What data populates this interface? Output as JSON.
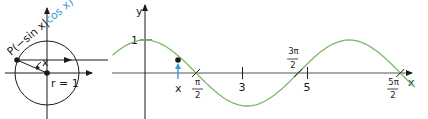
{
  "unit_circle": {
    "point_label_prefix": "P(−sin x|",
    "point_label_cos": "cos x",
    "point_label_suffix": ")",
    "angle_label": "x",
    "radius_label": "r = 1"
  },
  "graph": {
    "y_axis_label": "y",
    "x_axis_label": "x",
    "y_tick_label": "1",
    "marker_label": "x",
    "ticks": [
      {
        "num": "π",
        "den": "2",
        "value": 1.5708
      },
      {
        "label": "3",
        "value": 3
      },
      {
        "num": "3π",
        "den": "2",
        "value": 4.7124
      },
      {
        "label": "5",
        "value": 5
      },
      {
        "num": "5π",
        "den": "2",
        "value": 7.854
      }
    ]
  },
  "colors": {
    "curve": "#7bb86a",
    "accent": "#3a9ad9",
    "axis": "#1a1a1a",
    "baseline": "#555555"
  },
  "chart_data": {
    "type": "line",
    "title": "",
    "function": "y = cos x",
    "xlabel": "x",
    "ylabel": "y",
    "xlim": [
      -1.0,
      8.3
    ],
    "ylim": [
      -1,
      1
    ],
    "marked_x": 1.0,
    "x_ticks": [
      "π/2",
      "3",
      "3π/2",
      "5",
      "5π/2"
    ]
  }
}
